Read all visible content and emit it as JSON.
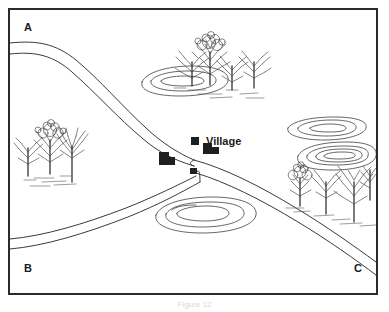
{
  "figure": {
    "caption": "Figure 12",
    "frame_color": "#2b2b2b",
    "background_color": "#ffffff",
    "ink_color": "#3a3a3a"
  },
  "map": {
    "corner_labels": [
      {
        "id": "A",
        "text": "A",
        "position": "top-left"
      },
      {
        "id": "B",
        "text": "B",
        "position": "bottom-left"
      },
      {
        "id": "C",
        "text": "C",
        "position": "bottom-right"
      }
    ],
    "place_labels": [
      {
        "id": "village",
        "text": "Village"
      }
    ],
    "roads": [
      {
        "id": "road-a",
        "from": "A",
        "to": "junction",
        "description": "road entering from top-left edge curving south-east to village junction"
      },
      {
        "id": "road-b",
        "from": "B",
        "to": "junction",
        "description": "road entering from bottom-left edge rising north-east to village junction"
      },
      {
        "id": "road-c",
        "from": "junction",
        "to": "C",
        "description": "road leaving junction heading south-east to bottom-right corner"
      }
    ],
    "buildings": [
      {
        "id": "building-1",
        "shape": "L-block"
      },
      {
        "id": "building-2",
        "shape": "square"
      },
      {
        "id": "building-3",
        "shape": "L-block"
      },
      {
        "id": "building-4",
        "shape": "square"
      }
    ],
    "contour_mounds": [
      {
        "id": "mound-nw",
        "rings": 3,
        "description": "concentric contour oval north-west of junction"
      },
      {
        "id": "mound-s",
        "rings": 3,
        "description": "concentric contour oval south of junction"
      },
      {
        "id": "mound-ne",
        "rings": 3,
        "description": "concentric contour oval upper right"
      },
      {
        "id": "mound-e",
        "rings": 4,
        "description": "concentric contour oval right of junction"
      }
    ],
    "tree_clusters": [
      {
        "id": "trees-north",
        "count": 4,
        "type": "bare-deciduous"
      },
      {
        "id": "trees-west",
        "count": 3,
        "type": "bare-deciduous"
      },
      {
        "id": "trees-east",
        "count": 4,
        "type": "bare-deciduous"
      }
    ]
  }
}
